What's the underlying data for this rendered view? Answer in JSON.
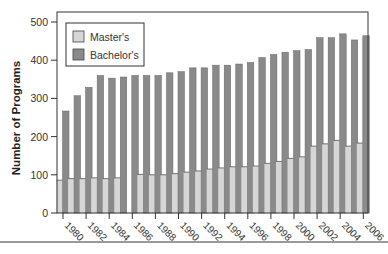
{
  "chart_data": {
    "type": "bar",
    "title": "",
    "xlabel": "",
    "ylabel": "Number of Programs",
    "ylim": [
      0,
      500
    ],
    "yticks": [
      0,
      100,
      200,
      300,
      400,
      500
    ],
    "xtick_labels": [
      "1980",
      "1982",
      "1984",
      "1986",
      "1988",
      "1990",
      "1992",
      "1994",
      "1996",
      "1998",
      "2000",
      "2002",
      "2004",
      "2006"
    ],
    "grid": false,
    "legend_position": "upper left",
    "categories": [
      "1980",
      "1981",
      "1982",
      "1983",
      "1984",
      "1985",
      "1986",
      "1987",
      "1988",
      "1989",
      "1990",
      "1991",
      "1992",
      "1993",
      "1994",
      "1995",
      "1996",
      "1997",
      "1998",
      "1999",
      "2000",
      "2001",
      "2002",
      "2003",
      "2004",
      "2005",
      "2006"
    ],
    "series": [
      {
        "name": "Master's",
        "color": "#d6d6d6",
        "values": [
          86,
          90,
          90,
          92,
          90,
          92,
          null,
          101,
          100,
          100,
          103,
          107,
          110,
          115,
          118,
          121,
          121,
          123,
          130,
          135,
          143,
          147,
          175,
          181,
          190,
          175,
          183
        ]
      },
      {
        "name": "Bachelor's",
        "color": "#8a8a8a",
        "values": [
          267,
          307,
          329,
          360,
          353,
          356,
          360,
          360,
          360,
          367,
          370,
          380,
          380,
          387,
          387,
          390,
          394,
          407,
          415,
          421,
          425,
          428,
          459,
          459,
          469,
          453,
          464
        ]
      }
    ]
  },
  "legend": {
    "items": [
      {
        "label": "Master's"
      },
      {
        "label": "Bachelor's"
      }
    ]
  }
}
